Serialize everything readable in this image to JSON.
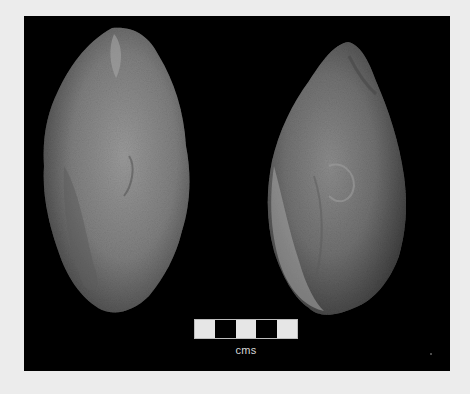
{
  "image": {
    "description": "Photograph of two stone hand axes on a black background with a scale bar",
    "background_color": "#ececec",
    "backdrop_color": "#000000"
  },
  "artifacts": [
    {
      "name": "left-hand-axe",
      "tone": "#8a8a8a"
    },
    {
      "name": "right-hand-axe",
      "tone": "#7c7c7c"
    }
  ],
  "scale_bar": {
    "segments": [
      "#e6e6e6",
      "#000000",
      "#e6e6e6",
      "#000000",
      "#e6e6e6"
    ],
    "label": "cms"
  }
}
